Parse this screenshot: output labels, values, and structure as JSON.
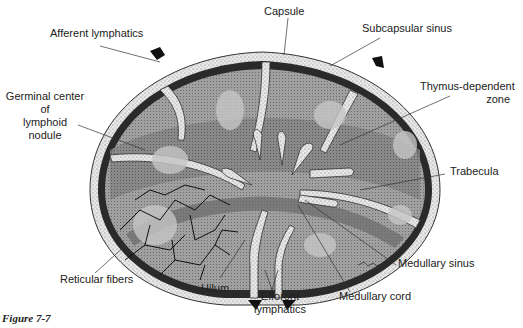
{
  "figure": {
    "caption": "Figure 7-7",
    "labels": {
      "afferent": "Afferent lymphatics",
      "capsule": "Capsule",
      "subcapsular": "Subcapsular sinus",
      "thymus1": "Thymus-dependent",
      "thymus2": "zone",
      "germinal1": "Germinal center",
      "germinal2": "of",
      "germinal3": "lymphoid",
      "germinal4": "nodule",
      "trabecula": "Trabecula",
      "reticular": "Reticular fibers",
      "hilum": "Hilum",
      "efferent1": "Efforont",
      "efferent2": "lymphatics",
      "medsinus": "Medullary sinus",
      "medcord": "Medullary cord"
    },
    "colors": {
      "capsule": "#e4e4e4",
      "sinus": "#2a2a2a",
      "cortex": "#9a9a9a",
      "paracortex": "#7a7a7a",
      "germinal": "#c4c4c4",
      "fibers": "#111111"
    }
  }
}
